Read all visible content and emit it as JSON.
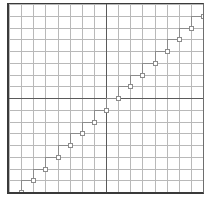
{
  "figure": {
    "title": "",
    "background_color": "#ffffff",
    "frame_color": "#3a3a3a",
    "width_px": 209,
    "height_px": 199
  },
  "grid": {
    "minor_color": "#b9b9b9",
    "major_color": "#5a5a5a",
    "columns": 16,
    "rows": 16,
    "major_x_index": 8,
    "major_y_index": 8,
    "show_grid": true,
    "axis_labels_visible": false,
    "tick_labels_visible": false
  },
  "chart_data": {
    "type": "line",
    "title": "",
    "subtitle": "",
    "xlabel": "",
    "ylabel": "",
    "grid": true,
    "legend": null,
    "legend_position": "none",
    "line_style": "step-post",
    "line_color": "#8c8c8c",
    "marker": "square-open",
    "marker_color": "#8c8c8c",
    "xlim": [
      0,
      16
    ],
    "ylim": [
      0,
      16
    ],
    "xticks": [
      0,
      1,
      2,
      3,
      4,
      5,
      6,
      7,
      8,
      9,
      10,
      11,
      12,
      13,
      14,
      15,
      16
    ],
    "yticks": [
      0,
      1,
      2,
      3,
      4,
      5,
      6,
      7,
      8,
      9,
      10,
      11,
      12,
      13,
      14,
      15,
      16
    ],
    "xtick_labels": [],
    "ytick_labels": [],
    "annotations": [],
    "series": [
      {
        "name": "step",
        "x": [
          0,
          1,
          2,
          3,
          4,
          5,
          6,
          7,
          8,
          9,
          10,
          11,
          12,
          13,
          14,
          15,
          16
        ],
        "values": [
          0,
          1,
          2,
          3,
          4,
          5,
          6,
          7,
          8,
          9,
          10,
          11,
          12,
          13,
          14,
          15,
          16
        ]
      }
    ]
  }
}
